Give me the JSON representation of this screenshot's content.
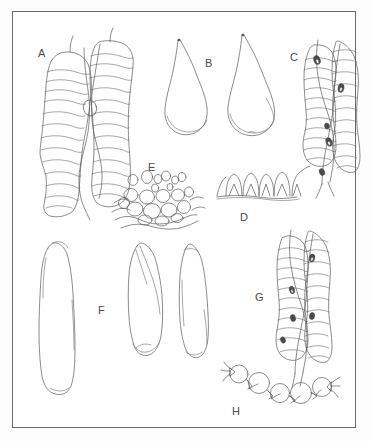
{
  "plate": {
    "title": "Comparative plate of microscopic structures",
    "border_color": "#6a6a6a",
    "ink_color": "#5a5a5a",
    "background_color": "#ffffff",
    "label_color": "#4a4a4a",
    "width": 370,
    "height": 441
  },
  "labels": {
    "a": "A",
    "b": "B",
    "c": "C",
    "d": "D",
    "e": "E",
    "f": "F",
    "g": "G",
    "h": "H"
  },
  "figures": [
    {
      "id": "A",
      "label": "A",
      "label_x": 38,
      "label_y": 48,
      "description": "Two overlapping elongate transversely-striated filament segments, banded with numerous fine cross lines, twisting around one another"
    },
    {
      "id": "B",
      "label": "B",
      "label_x": 205,
      "label_y": 58,
      "description": "Two pear / teardrop shaped bodies with long drawn-out pointed apices and broad rounded bases"
    },
    {
      "id": "C",
      "label": "C",
      "label_x": 290,
      "label_y": 52,
      "description": "Pair of transversely striated filaments bearing small dark ovate attached bodies along their length"
    },
    {
      "id": "D",
      "label": "D",
      "label_x": 240,
      "label_y": 212,
      "description": "Row of five dome-shaped papillae with triangular basal attachments arranged along a horizontal surface line"
    },
    {
      "id": "E",
      "label": "E",
      "label_x": 148,
      "label_y": 162,
      "description": "Mound-shaped cluster of rounded cells and vesicles of graded sizes, smaller above, larger below"
    },
    {
      "id": "F",
      "label": "F",
      "label_x": 98,
      "label_y": 305,
      "description": "Three elongate spindle / oblong bodies, one large at left and two narrower at right"
    },
    {
      "id": "G",
      "label": "G",
      "label_x": 255,
      "label_y": 292,
      "description": "Pair of transversely striated filaments with small dark nodes, similar to figure C"
    },
    {
      "id": "H",
      "label": "H",
      "label_x": 232,
      "label_y": 406,
      "description": "Curved chain of six rounded cells joined by narrow collared isthmuses with spiny projections"
    }
  ]
}
